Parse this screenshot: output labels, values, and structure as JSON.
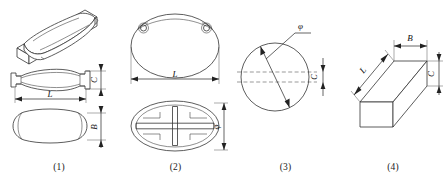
{
  "figure": {
    "background_color": "#ffffff",
    "line_color": "#333333",
    "text_color": "#111111"
  },
  "panels": [
    {
      "id": "panel-1",
      "caption": "(1)",
      "description": "dog-bone / fish-plate shaped element",
      "views": [
        "isometric",
        "front-elevation",
        "plan"
      ],
      "dimensions": [
        {
          "symbol": "L",
          "orientation": "horizontal",
          "view": "front-elevation"
        },
        {
          "symbol": "C",
          "orientation": "vertical",
          "view": "front-elevation"
        },
        {
          "symbol": "B",
          "orientation": "vertical",
          "view": "plan"
        }
      ]
    },
    {
      "id": "panel-2",
      "caption": "(2)",
      "description": "elliptical element with two lifting holes and cross ribs",
      "views": [
        "plan-top",
        "plan-bottom"
      ],
      "dimensions": [
        {
          "symbol": "L",
          "orientation": "horizontal",
          "view": "plan-top"
        },
        {
          "symbol": "φ",
          "orientation": "vertical",
          "view": "plan-bottom"
        }
      ]
    },
    {
      "id": "panel-3",
      "caption": "(3)",
      "description": "circular disc element shown in plan with diameter and thickness",
      "views": [
        "plan",
        "edge"
      ],
      "dimensions": [
        {
          "symbol": "φ",
          "orientation": "diagonal",
          "view": "plan"
        },
        {
          "symbol": "C",
          "orientation": "vertical",
          "view": "edge"
        }
      ]
    },
    {
      "id": "panel-4",
      "caption": "(4)",
      "description": "rectangular prism / bar element shown in isometric",
      "views": [
        "isometric"
      ],
      "dimensions": [
        {
          "symbol": "L",
          "orientation": "diagonal"
        },
        {
          "symbol": "B",
          "orientation": "horizontal"
        },
        {
          "symbol": "C",
          "orientation": "vertical"
        }
      ]
    }
  ],
  "labels": {
    "L": "L",
    "B": "B",
    "C": "C",
    "phi": "φ"
  }
}
